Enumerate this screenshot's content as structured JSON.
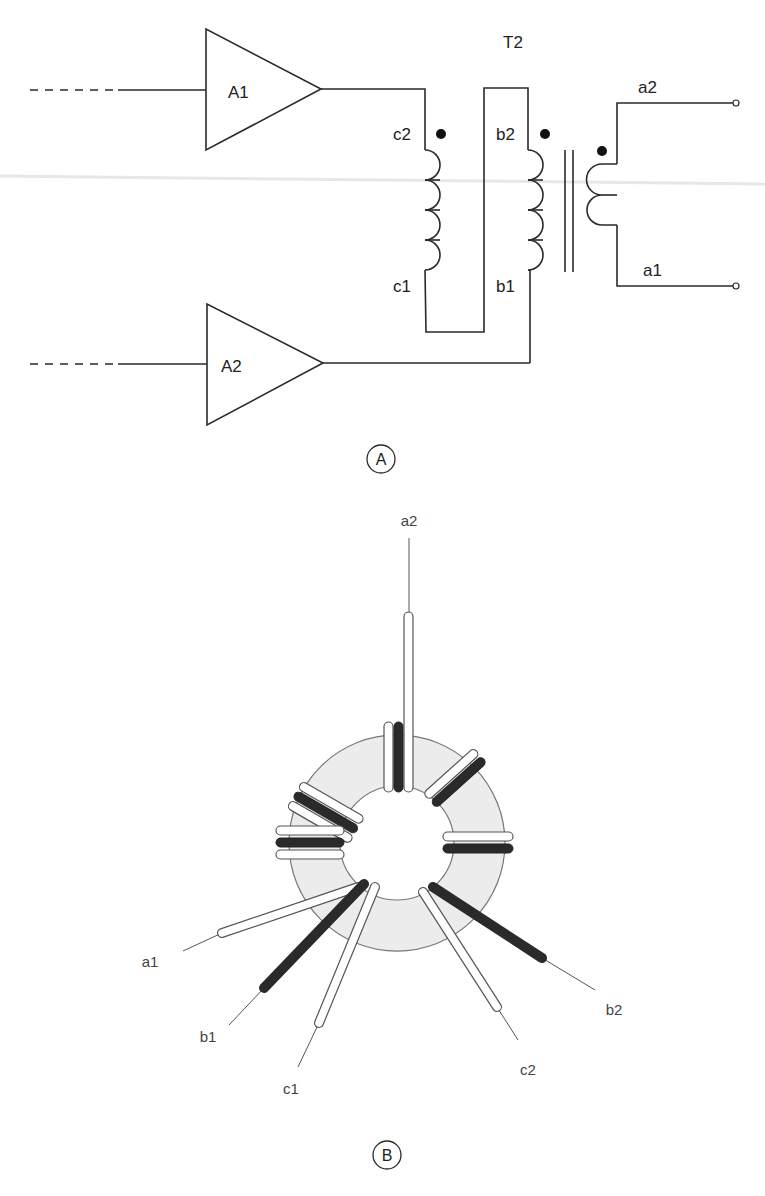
{
  "figure_a": {
    "panel_label": "A",
    "transformer_label": "T2",
    "amplifiers": [
      {
        "id": "A1",
        "label": "A1"
      },
      {
        "id": "A2",
        "label": "A2"
      }
    ],
    "winding_labels": {
      "c2": "c2",
      "c1": "c1",
      "b2": "b2",
      "b1": "b1",
      "a2": "a2",
      "a1": "a1"
    },
    "polarity_dots": [
      "c2",
      "b2",
      "a2"
    ]
  },
  "figure_b": {
    "panel_label": "B",
    "description": "Toroidal core with trifilar windings (a, b, c)",
    "lead_labels": {
      "a2": "a2",
      "a1": "a1",
      "b1": "b1",
      "c1": "c1",
      "c2": "c2",
      "b2": "b2"
    },
    "colors": {
      "core_fill": "#ececec",
      "core_stroke": "#777777",
      "black_wire": "#2a2a2a",
      "white_wire": "#ffffff"
    }
  }
}
